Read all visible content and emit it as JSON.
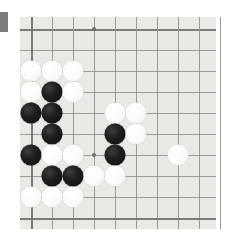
{
  "scene": {
    "type": "go-board-photo",
    "title": "Go board corner position",
    "background_color": "#ffffff",
    "board_color": "#e9e9e6",
    "line_color": "#9a9a9a",
    "edge_line_color": "#7a7a78",
    "black_stone_color": "#1d1d1d",
    "white_stone_color": "#fbfbfb",
    "marker_color": "#7c7c7c"
  },
  "board": {
    "left": 20,
    "top": 17,
    "width": 196,
    "height": 212,
    "origin_x": 31,
    "origin_y": 29,
    "spacing": 21,
    "cols": 10,
    "rows": 10,
    "edge_left_col": 0,
    "edge_top_row": 0,
    "star_points": [
      {
        "col": 3,
        "row": 0
      },
      {
        "col": 3,
        "row": 6
      }
    ]
  },
  "left_marker": {
    "x": 0,
    "y": 12,
    "width": 8,
    "height": 20
  },
  "stones": [
    {
      "col": 0,
      "row": 2,
      "color": "white"
    },
    {
      "col": 1,
      "row": 2,
      "color": "white"
    },
    {
      "col": 2,
      "row": 2,
      "color": "white"
    },
    {
      "col": 0,
      "row": 3,
      "color": "white"
    },
    {
      "col": 1,
      "row": 3,
      "color": "black"
    },
    {
      "col": 2,
      "row": 3,
      "color": "white"
    },
    {
      "col": 0,
      "row": 4,
      "color": "black"
    },
    {
      "col": 1,
      "row": 4,
      "color": "black"
    },
    {
      "col": 4,
      "row": 4,
      "color": "white"
    },
    {
      "col": 5,
      "row": 4,
      "color": "white"
    },
    {
      "col": 1,
      "row": 5,
      "color": "black"
    },
    {
      "col": 4,
      "row": 5,
      "color": "black"
    },
    {
      "col": 5,
      "row": 5,
      "color": "white"
    },
    {
      "col": 0,
      "row": 6,
      "color": "black"
    },
    {
      "col": 1,
      "row": 6,
      "color": "white"
    },
    {
      "col": 2,
      "row": 6,
      "color": "white"
    },
    {
      "col": 4,
      "row": 6,
      "color": "black"
    },
    {
      "col": 7,
      "row": 6,
      "color": "white"
    },
    {
      "col": 1,
      "row": 7,
      "color": "black"
    },
    {
      "col": 2,
      "row": 7,
      "color": "black"
    },
    {
      "col": 3,
      "row": 7,
      "color": "white"
    },
    {
      "col": 4,
      "row": 7,
      "color": "white"
    },
    {
      "col": 0,
      "row": 8,
      "color": "white"
    },
    {
      "col": 1,
      "row": 8,
      "color": "white"
    },
    {
      "col": 2,
      "row": 8,
      "color": "white"
    }
  ],
  "counts": {
    "black": 9,
    "white": 15,
    "total": 24
  }
}
